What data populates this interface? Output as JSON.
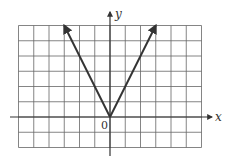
{
  "chart_data": {
    "type": "line",
    "title": "",
    "xlabel": "x",
    "ylabel": "y",
    "origin_label": "0",
    "grid": true,
    "xlim": [
      -6,
      6
    ],
    "ylim": [
      -2,
      6
    ],
    "function": "y = 2|x|",
    "series": [
      {
        "name": "left branch",
        "x": [
          0,
          -3
        ],
        "y": [
          0,
          6
        ],
        "arrow": true
      },
      {
        "name": "right branch",
        "x": [
          0,
          3
        ],
        "y": [
          0,
          6
        ],
        "arrow": true
      }
    ],
    "colors": {
      "line": "#333333",
      "grid": "#555555",
      "axis": "#333333"
    }
  }
}
